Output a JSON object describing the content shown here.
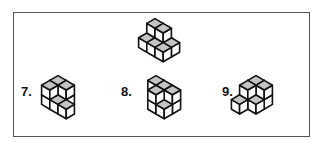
{
  "colors": {
    "top_face": "#c4c4c4",
    "side_face": "#ffffff",
    "stroke": "#111111",
    "frame": "#555555"
  },
  "reference_figure": {
    "cubes": [
      [
        0,
        0,
        1
      ],
      [
        1,
        0,
        1
      ],
      [
        0,
        0,
        0
      ],
      [
        1,
        0,
        0
      ],
      [
        0,
        1,
        0
      ],
      [
        1,
        1,
        0
      ],
      [
        2,
        0,
        0
      ],
      [
        2,
        1,
        0
      ]
    ]
  },
  "options": [
    {
      "label": "7.",
      "cubes": [
        [
          0,
          0,
          1
        ],
        [
          1,
          0,
          1
        ],
        [
          0,
          1,
          1
        ],
        [
          0,
          0,
          0
        ],
        [
          1,
          0,
          0
        ],
        [
          0,
          1,
          0
        ],
        [
          1,
          1,
          0
        ],
        [
          2,
          1,
          0
        ]
      ]
    },
    {
      "label": "8.",
      "cubes": [
        [
          0,
          0,
          1
        ],
        [
          1,
          0,
          1
        ],
        [
          2,
          0,
          1
        ],
        [
          1,
          1,
          1
        ],
        [
          1,
          0,
          0
        ],
        [
          2,
          0,
          0
        ],
        [
          1,
          1,
          0
        ],
        [
          2,
          1,
          0
        ]
      ]
    },
    {
      "label": "9.",
      "cubes": [
        [
          0,
          0,
          1
        ],
        [
          1,
          0,
          1
        ],
        [
          0,
          1,
          1
        ],
        [
          0,
          0,
          0
        ],
        [
          1,
          0,
          0
        ],
        [
          0,
          1,
          0
        ],
        [
          1,
          1,
          0
        ],
        [
          0,
          2,
          0
        ]
      ]
    }
  ]
}
